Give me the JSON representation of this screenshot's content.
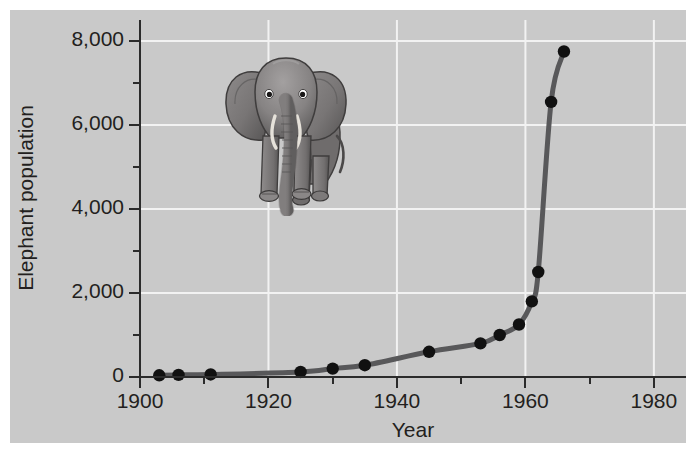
{
  "chart_data": {
    "type": "line",
    "title": "",
    "xlabel": "Year",
    "ylabel": "Elephant population",
    "xlim": [
      1900,
      1985
    ],
    "ylim": [
      0,
      8500
    ],
    "xticks": [
      1900,
      1920,
      1940,
      1960,
      1980
    ],
    "xticklabels": [
      "1900",
      "1920",
      "1940",
      "1960",
      "1980"
    ],
    "xminorticks": [
      1910,
      1930,
      1950,
      1970
    ],
    "yticks": [
      0,
      2000,
      4000,
      6000,
      8000
    ],
    "yticklabels": [
      "0",
      "2,000",
      "4,000",
      "6,000",
      "8,000"
    ],
    "yminorticks": [
      1000,
      3000,
      5000,
      7000
    ],
    "grid": true,
    "grid_color": "#f2f2f2",
    "background_color": "#c9c9c9",
    "line_color": "#58585a",
    "marker_color": "#111111",
    "series": [
      {
        "name": "Elephant population",
        "x": [
          1903,
          1906,
          1911,
          1925,
          1930,
          1935,
          1945,
          1953,
          1956,
          1959,
          1961,
          1962,
          1964,
          1966
        ],
        "y": [
          40,
          50,
          60,
          120,
          200,
          280,
          600,
          800,
          1000,
          1250,
          1800,
          2500,
          6550,
          7750
        ]
      }
    ],
    "annotations": [
      {
        "name": "elephant-illustration",
        "description": "Front-facing grayscale illustration of an African elephant"
      }
    ]
  }
}
